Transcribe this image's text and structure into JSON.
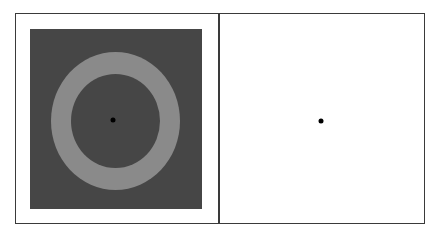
{
  "figure": {
    "panels": [
      {
        "id": "left",
        "description": "Gray annulus on dark gray background with central fixation dot",
        "background_color": "#464646",
        "ring_color": "#8a8a8a",
        "fixation_dot_color": "#000000"
      },
      {
        "id": "right",
        "description": "Blank white field with central fixation dot",
        "background_color": "#ffffff",
        "fixation_dot_color": "#000000"
      }
    ],
    "frame_color": "#3a3a3a"
  }
}
